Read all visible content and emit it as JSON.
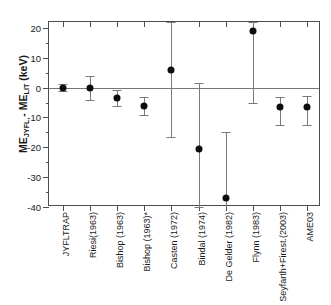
{
  "chart_data": {
    "type": "scatter",
    "title": "",
    "xlabel": "",
    "ylabel": "ME_JYFL - ME_LIT (keV)",
    "ylabel_parts": {
      "lead": "ME",
      "sub1": "JYFL",
      "mid": " - ME",
      "sub2": "LIT",
      "tail": " (keV)"
    },
    "ylim": [
      -40,
      22
    ],
    "yticks": [
      20,
      10,
      0,
      -10,
      -20,
      -30,
      -40
    ],
    "ytick_labels": [
      "20",
      "10",
      "0",
      "-10",
      "-20",
      "-30",
      "-40"
    ],
    "yminor_step": 5,
    "grid": false,
    "legend": "none",
    "zero_reference_line": 0,
    "categories": [
      "JYFLTRAP",
      "Riesi(1963)",
      "Bishop (1963)",
      "Bishop (1963)*",
      "Casten (1972)",
      "Bindal (1974)",
      "De Gelder (1982)",
      "Flynn (1983)",
      "Seyfarth+Firest.(2003)",
      "AME03"
    ],
    "values": [
      0.0,
      0.0,
      -3.5,
      -6.2,
      6.0,
      -20.5,
      -37.0,
      19.0,
      -6.5,
      -6.4
    ],
    "err_low": [
      1.2,
      4.0,
      2.8,
      3.0,
      22.5,
      19.5,
      22.0,
      24.0,
      6.0,
      6.2
    ],
    "err_high": [
      1.2,
      4.0,
      2.8,
      3.0,
      16.0,
      22.0,
      22.0,
      3.0,
      3.5,
      3.6
    ],
    "marker": "filled-circle",
    "marker_color": "#0d0d0d",
    "errorbar_color": "#7a7a7a",
    "axis_color": "#4d4d4d",
    "background": "#ffffff"
  }
}
